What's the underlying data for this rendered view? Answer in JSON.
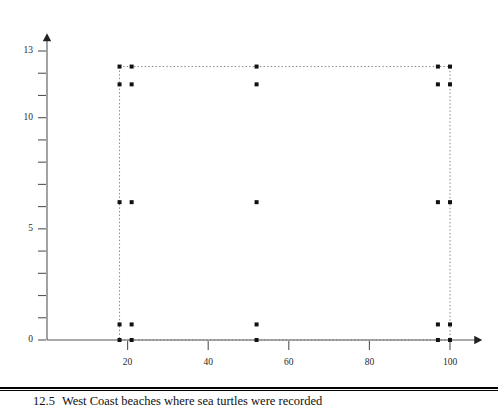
{
  "figure": {
    "caption_number": "12.5",
    "caption_text": "West Coast beaches where sea turtles were recorded"
  },
  "chart_data": {
    "type": "scatter",
    "title": "",
    "xlabel": "",
    "ylabel": "",
    "xlim": [
      0,
      108
    ],
    "ylim": [
      0,
      13.8
    ],
    "grid": false,
    "legend": "none",
    "axis_style": "arrow-tipped",
    "x_ticks": [
      20,
      40,
      60,
      80,
      100
    ],
    "x_tick_labels": [
      "20",
      "40",
      "60",
      "80",
      "100"
    ],
    "y_ticks": [
      0,
      1,
      2,
      3,
      4,
      5,
      6,
      7,
      8,
      9,
      10,
      11,
      12,
      13
    ],
    "y_tick_labels": [
      "0",
      "",
      "",
      "",
      "",
      "5",
      "",
      "",
      "",
      "",
      "10",
      "",
      "",
      "13"
    ],
    "marker_color": "#111111",
    "boundary_color": "#777777",
    "boundary_style": "dotted",
    "boundary_rect": {
      "x0": 18,
      "y0": 0,
      "x1": 100,
      "y1": 12.3
    },
    "points": [
      {
        "x": 18,
        "y": 12.3
      },
      {
        "x": 21,
        "y": 12.3
      },
      {
        "x": 52,
        "y": 12.3
      },
      {
        "x": 97,
        "y": 12.3
      },
      {
        "x": 100,
        "y": 12.3
      },
      {
        "x": 18,
        "y": 11.5
      },
      {
        "x": 21,
        "y": 11.5
      },
      {
        "x": 52,
        "y": 11.5
      },
      {
        "x": 97,
        "y": 11.5
      },
      {
        "x": 100,
        "y": 11.5
      },
      {
        "x": 18,
        "y": 6.2
      },
      {
        "x": 21,
        "y": 6.2
      },
      {
        "x": 52,
        "y": 6.2
      },
      {
        "x": 97,
        "y": 6.2
      },
      {
        "x": 100,
        "y": 6.2
      },
      {
        "x": 18,
        "y": 0.7
      },
      {
        "x": 21,
        "y": 0.7
      },
      {
        "x": 52,
        "y": 0.7
      },
      {
        "x": 97,
        "y": 0.7
      },
      {
        "x": 100,
        "y": 0.7
      },
      {
        "x": 18,
        "y": 0
      },
      {
        "x": 21,
        "y": 0
      },
      {
        "x": 52,
        "y": 0
      },
      {
        "x": 97,
        "y": 0
      },
      {
        "x": 100,
        "y": 0
      }
    ]
  }
}
